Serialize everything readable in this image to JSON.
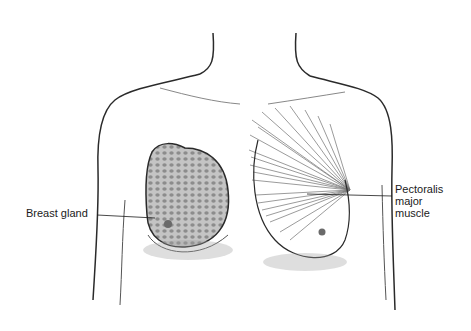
{
  "diagram": {
    "labels": {
      "breast_gland": "Breast gland",
      "pectoralis": [
        "Pectoralis",
        "major",
        "muscle"
      ]
    },
    "colors": {
      "line": "#2a2a2a",
      "shade": "#9a9a9a",
      "gland_fill": "#bdbdbd",
      "background": "#ffffff"
    }
  }
}
